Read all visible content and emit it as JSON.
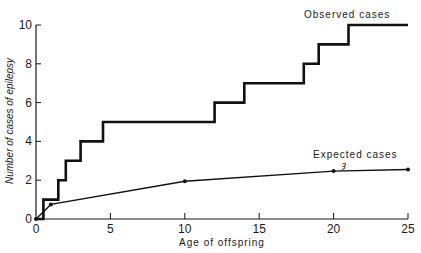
{
  "chart_data": {
    "type": "line",
    "title": "",
    "xlabel": "Age of offspring",
    "ylabel": "Number of cases of epilepsy",
    "xlim": [
      0,
      25
    ],
    "ylim": [
      0,
      10
    ],
    "xticks": [
      0,
      5,
      10,
      15,
      20,
      25
    ],
    "yticks": [
      0,
      2,
      4,
      6,
      8,
      10
    ],
    "grid": false,
    "legend": "inline labels",
    "series": [
      {
        "name": "Observed cases",
        "style": "step",
        "x": [
          0,
          0.5,
          0.5,
          1.5,
          1.5,
          2,
          2,
          3,
          3,
          4.5,
          4.5,
          12,
          12,
          14,
          14,
          18,
          18,
          19,
          19,
          21,
          21,
          25
        ],
        "y": [
          0,
          0,
          1,
          1,
          2,
          2,
          3,
          3,
          4,
          4,
          5,
          5,
          6,
          6,
          7,
          7,
          8,
          8,
          9,
          9,
          10,
          10
        ]
      },
      {
        "name": "Expected cases",
        "style": "line-with-markers",
        "x": [
          0,
          1,
          10,
          20,
          25
        ],
        "y": [
          0,
          0.75,
          1.95,
          2.47,
          2.55
        ]
      }
    ],
    "annotations": [
      {
        "text": "Observed cases",
        "x": 19.5,
        "y": 10.6
      },
      {
        "text": "Expected cases",
        "x": 19.5,
        "y": 3.2
      }
    ]
  }
}
